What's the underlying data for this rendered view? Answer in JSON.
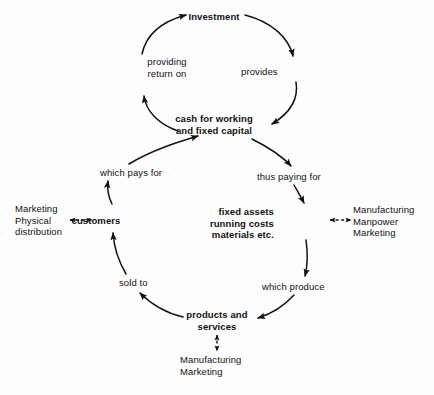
{
  "diagram": {
    "nodes": [
      {
        "id": "investment",
        "label": "Investment",
        "bold": true
      },
      {
        "id": "cash",
        "label": "cash for working\nand fixed capital",
        "bold": true
      },
      {
        "id": "customers",
        "label": "customers",
        "bold": true
      },
      {
        "id": "fixed_assets",
        "label": "fixed assets\nrunning costs\nmaterials etc.",
        "bold": true
      },
      {
        "id": "products",
        "label": "products and\nservices",
        "bold": true
      }
    ],
    "edge_labels": [
      {
        "id": "provides",
        "label": "provides",
        "from": "investment",
        "to": "cash"
      },
      {
        "id": "providing_return_on",
        "label": "providing\nreturn on",
        "from": "cash",
        "to": "investment"
      },
      {
        "id": "which_pays_for",
        "label": "which pays for",
        "from": "customers",
        "to": "cash"
      },
      {
        "id": "thus_paying_for",
        "label": "thus paying for",
        "from": "cash",
        "to": "fixed_assets"
      },
      {
        "id": "sold_to",
        "label": "sold to",
        "from": "products",
        "to": "customers"
      },
      {
        "id": "which_produce",
        "label": "which produce",
        "from": "fixed_assets",
        "to": "products"
      }
    ],
    "side_labels": [
      {
        "id": "left_functions",
        "label": "Marketing\nPhysical\ndistribution",
        "linked_to": "customers",
        "link": "dashed-double-arrow"
      },
      {
        "id": "right_functions",
        "label": "Manufacturing\nManpower\nMarketing",
        "linked_to": "fixed_assets",
        "link": "dashed-double-arrow"
      },
      {
        "id": "bottom_functions",
        "label": "Manufacturing\nMarketing",
        "linked_to": "products",
        "link": "dashed-double-arrow"
      }
    ],
    "colors": {
      "ink": "#111111",
      "background": "#fdfdfd"
    }
  }
}
